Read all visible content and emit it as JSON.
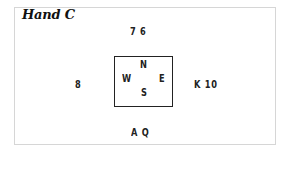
{
  "diagram": {
    "title": "Hand C",
    "hands": {
      "north": "7 6",
      "west": "8",
      "east": "K 10",
      "south": "A Q"
    },
    "compass": {
      "n": "N",
      "w": "W",
      "e": "E",
      "s": "S"
    }
  }
}
